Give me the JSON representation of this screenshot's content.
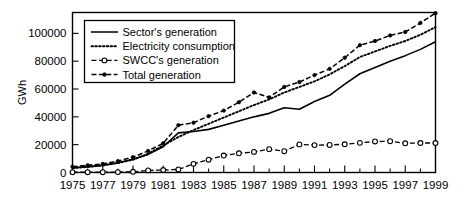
{
  "chart_data": {
    "type": "line",
    "title": "",
    "xlabel": "",
    "ylabel": "GWh",
    "xlim": [
      1975,
      1999
    ],
    "ylim": [
      0,
      115000
    ],
    "grid": false,
    "legend_position": "top-left",
    "x": [
      1975,
      1976,
      1977,
      1978,
      1979,
      1980,
      1981,
      1982,
      1983,
      1984,
      1985,
      1986,
      1987,
      1988,
      1989,
      1990,
      1991,
      1992,
      1993,
      1994,
      1995,
      1996,
      1997,
      1998,
      1999
    ],
    "xtick_labels": [
      "1975",
      "1977",
      "1979",
      "1981",
      "1983",
      "1985",
      "1987",
      "1989",
      "1991",
      "1993",
      "1995",
      "1997",
      "1999"
    ],
    "xtick_values": [
      1975,
      1977,
      1979,
      1981,
      1983,
      1985,
      1987,
      1989,
      1991,
      1993,
      1995,
      1997,
      1999
    ],
    "xtick_minor_values": [
      1976,
      1978,
      1980,
      1982,
      1984,
      1986,
      1988,
      1990,
      1992,
      1994,
      1996,
      1998
    ],
    "ytick_labels": [
      "0",
      "20000",
      "40000",
      "60000",
      "80000",
      "100000"
    ],
    "ytick_values": [
      0,
      20000,
      40000,
      60000,
      80000,
      100000
    ],
    "series": [
      {
        "name": "Sector's generation",
        "style": "solid",
        "marker": "none",
        "values": [
          3300,
          4200,
          5200,
          7000,
          9500,
          13000,
          18500,
          28500,
          29500,
          31000,
          34000,
          37000,
          40000,
          42500,
          46500,
          45500,
          51000,
          55500,
          63500,
          71000,
          75500,
          80000,
          84000,
          88500,
          94000
        ]
      },
      {
        "name": "Electricity consumption",
        "style": "dotted",
        "marker": "none",
        "values": [
          3200,
          4000,
          5000,
          6800,
          9200,
          13500,
          19500,
          25500,
          30500,
          35000,
          39500,
          44000,
          48500,
          52500,
          57500,
          61500,
          65500,
          70500,
          76500,
          83000,
          87000,
          91000,
          94500,
          99000,
          104500
        ]
      },
      {
        "name": "SWCC's generation",
        "style": "dash-open",
        "marker": "open-circle",
        "values": [
          200,
          200,
          200,
          300,
          500,
          1500,
          1800,
          2200,
          6200,
          9200,
          12200,
          13800,
          14800,
          16800,
          15300,
          20200,
          19700,
          19800,
          20300,
          21300,
          22300,
          22500,
          21000,
          21200,
          21200
        ]
      },
      {
        "name": "Total generation",
        "style": "dash-filled",
        "marker": "filled-circle",
        "values": [
          4200,
          5200,
          6200,
          8200,
          11000,
          15500,
          21000,
          34000,
          35800,
          40500,
          44500,
          50500,
          57500,
          54000,
          61500,
          65000,
          70000,
          74500,
          82500,
          91500,
          94500,
          98500,
          101000,
          107500,
          114500
        ]
      }
    ]
  },
  "legend": {
    "entries": [
      {
        "label": "Sector's generation"
      },
      {
        "label": "Electricity consumption"
      },
      {
        "label": "SWCC's generation"
      },
      {
        "label": "Total generation"
      }
    ]
  },
  "axes": {
    "y_axis_title": "GWh"
  }
}
